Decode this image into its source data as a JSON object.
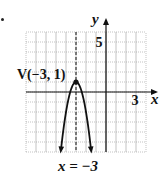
{
  "exercise": {
    "bullet": "•"
  },
  "chart_data": {
    "type": "line",
    "title": "",
    "function": "y = -3(x + 3)^2 + 1",
    "xlabel": "x",
    "ylabel": "y",
    "xlim": [
      -8,
      4
    ],
    "ylim": [
      -6,
      6
    ],
    "grid": true,
    "tick_labels": {
      "x": [
        {
          "value": 3,
          "label": "3"
        }
      ],
      "y": [
        {
          "value": 5,
          "label": "5"
        }
      ]
    },
    "vertex": {
      "x": -3,
      "y": 1,
      "label": "V(−3, 1)"
    },
    "axis_of_symmetry": {
      "x": -3,
      "label": "x = −3",
      "style": "dashed"
    },
    "series": [
      {
        "name": "parabola",
        "x": [
          -4.5,
          -4.25,
          -4,
          -3.75,
          -3.5,
          -3.25,
          -3,
          -2.75,
          -2.5,
          -2.25,
          -2,
          -1.75,
          -1.5
        ],
        "values": [
          -5.75,
          -3.69,
          -2,
          -0.69,
          0.25,
          0.81,
          1,
          0.81,
          0.25,
          -0.69,
          -2,
          -3.69,
          -5.75
        ]
      }
    ]
  },
  "colors": {
    "grid": "#9a9a9a",
    "axis": "#111111",
    "curve": "#111111",
    "text": "#111111"
  }
}
